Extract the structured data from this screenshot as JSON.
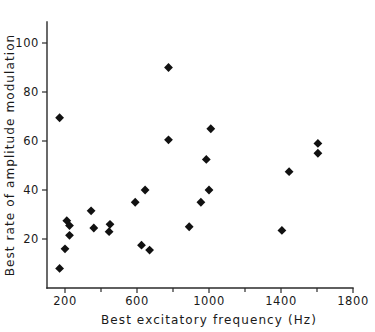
{
  "chart_data": {
    "type": "scatter",
    "title": "",
    "xlabel": "Best excitatory frequency  (Hz)",
    "ylabel": "Best rate of amplitude modulation",
    "xlim": [
      100,
      1800
    ],
    "ylim": [
      0,
      108
    ],
    "grid": false,
    "legend": "none",
    "marker": "filled-diamond",
    "marker_color": "#111111",
    "xticks": [
      200,
      600,
      1000,
      1400,
      1800
    ],
    "xtick_labels": [
      "200",
      "600",
      "1000",
      "1400",
      "1800"
    ],
    "xminor_ticks": [
      400,
      800,
      1200,
      1600
    ],
    "yticks": [
      20,
      40,
      60,
      80,
      100
    ],
    "ytick_labels": [
      "20",
      "40",
      "60",
      "80",
      "100"
    ],
    "points": [
      {
        "x": 170,
        "y": 69.5
      },
      {
        "x": 170,
        "y": 8.0
      },
      {
        "x": 200,
        "y": 16.0
      },
      {
        "x": 210,
        "y": 27.5
      },
      {
        "x": 225,
        "y": 25.5
      },
      {
        "x": 225,
        "y": 21.5
      },
      {
        "x": 345,
        "y": 31.5
      },
      {
        "x": 360,
        "y": 24.5
      },
      {
        "x": 450,
        "y": 26.0
      },
      {
        "x": 445,
        "y": 23.0
      },
      {
        "x": 590,
        "y": 35.0
      },
      {
        "x": 645,
        "y": 40.0
      },
      {
        "x": 625,
        "y": 17.5
      },
      {
        "x": 670,
        "y": 15.5
      },
      {
        "x": 775,
        "y": 90.0
      },
      {
        "x": 775,
        "y": 60.5
      },
      {
        "x": 890,
        "y": 25.0
      },
      {
        "x": 955,
        "y": 35.0
      },
      {
        "x": 985,
        "y": 52.5
      },
      {
        "x": 1000,
        "y": 40.0
      },
      {
        "x": 1010,
        "y": 65.0
      },
      {
        "x": 1405,
        "y": 23.5
      },
      {
        "x": 1445,
        "y": 47.5
      },
      {
        "x": 1605,
        "y": 59.0
      },
      {
        "x": 1605,
        "y": 55.0
      }
    ]
  },
  "axes": {
    "x_axis_label": "Best excitatory frequency  (Hz)",
    "y_axis_label": "Best rate of amplitude modulation"
  }
}
